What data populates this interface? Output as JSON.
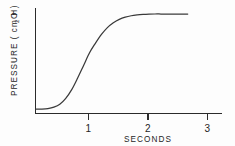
{
  "chart_data": {
    "type": "line",
    "title": "",
    "subtitle": "",
    "xlabel": "SECONDS",
    "ylabel_parts": {
      "main": "PRESSURE  ( cm H",
      "subscript": "2",
      "tail": "O )"
    },
    "ylabel": "PRESSURE (cm H2O)",
    "xlim": [
      0,
      3.18
    ],
    "ylim": [
      0,
      1.06
    ],
    "xticks": [
      1,
      2,
      3
    ],
    "xticklabels": [
      "1",
      "2",
      "3"
    ],
    "yticks": [],
    "yticklabels": [],
    "grid": false,
    "legend": false,
    "legend_position": "none",
    "series": [
      {
        "name": "pressure",
        "x": [
          0.0,
          0.1,
          0.2,
          0.3,
          0.4,
          0.5,
          0.6,
          0.7,
          0.8,
          0.9,
          1.0,
          1.1,
          1.2,
          1.3,
          1.4,
          1.5,
          1.6,
          1.7,
          1.8,
          1.9,
          2.0,
          2.1,
          2.2,
          2.3,
          2.4,
          2.5,
          2.55
        ],
        "y": [
          0.02,
          0.02,
          0.025,
          0.04,
          0.07,
          0.13,
          0.22,
          0.34,
          0.47,
          0.6,
          0.7,
          0.79,
          0.86,
          0.91,
          0.945,
          0.968,
          0.982,
          0.99,
          0.995,
          0.998,
          1.0,
          1.0,
          1.0,
          1.0,
          1.0,
          1.0,
          1.0
        ]
      }
    ],
    "annotations": [],
    "colors": {
      "curve": "#3a3a3a",
      "axis": "#2b2b2b",
      "text": "#262626",
      "background": "#fdfdfd"
    },
    "geometry": {
      "origin_x": 35,
      "origin_y": 113,
      "axis_top_y": 8,
      "axis_right_x": 222,
      "px_per_second": 59.5,
      "plateau_y": 14,
      "baseline_y": 111,
      "curve_end_x": 185,
      "tick_length": 6
    }
  }
}
